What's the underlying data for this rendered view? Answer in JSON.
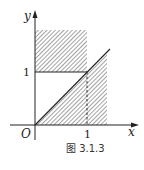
{
  "diagram": {
    "caption": "图 3.1.3",
    "axes": {
      "x_label": "x",
      "y_label": "y",
      "origin_label": "O",
      "x_tick_label": "1",
      "y_tick_label": "1"
    },
    "regions": [
      {
        "name": "upper-rectangle",
        "description": "0 ≤ x ≤ 1, y ≥ 1 (shaded)"
      },
      {
        "name": "lower-triangle",
        "description": "0 ≤ y ≤ x (shaded, below line y = x)"
      }
    ],
    "lines": [
      {
        "name": "line-y-equals-x",
        "style": "solid"
      },
      {
        "name": "line-y-equals-1",
        "style": "solid",
        "from_x": 0,
        "to_x": 1
      },
      {
        "name": "line-x-equals-1",
        "style": "dashed",
        "from_y": 0,
        "to_y": 1
      }
    ],
    "colors": {
      "ink": "#222222",
      "hatch": "#555555",
      "background": "#ffffff"
    }
  }
}
